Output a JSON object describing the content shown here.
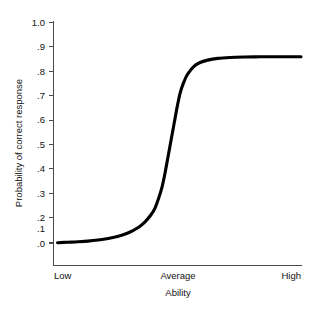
{
  "chart_data": {
    "type": "line",
    "title": "",
    "xlabel": "Ability",
    "ylabel": "Probability of correct response",
    "grid": false,
    "legend": "none",
    "xlim": [
      -3,
      3
    ],
    "ylim": [
      0,
      1
    ],
    "x_tick_labels": [
      "Low",
      "Average",
      "High"
    ],
    "x_tick_values": [
      -3,
      0,
      3
    ],
    "y_tick_labels": [
      "1.0",
      ".9",
      ".8",
      ".7",
      ".6",
      ".5",
      ".4",
      ".3",
      ".2",
      ".1",
      ".0"
    ],
    "y_tick_values": [
      1.0,
      0.9,
      0.8,
      0.7,
      0.6,
      0.5,
      0.4,
      0.3,
      0.2,
      0.1,
      0.0
    ],
    "series": [
      {
        "name": "Item characteristic curve",
        "x": [
          -3.0,
          -2.75,
          -2.5,
          -2.25,
          -2.0,
          -1.75,
          -1.5,
          -1.25,
          -1.0,
          -0.85,
          -0.7,
          -0.6,
          -0.5,
          -0.42,
          -0.35,
          -0.28,
          -0.2,
          -0.12,
          -0.05,
          0.02,
          0.1,
          0.2,
          0.35,
          0.5,
          0.7,
          0.95,
          1.25,
          1.6,
          2.0,
          2.4,
          2.8,
          3.0
        ],
        "y": [
          0.005,
          0.007,
          0.009,
          0.012,
          0.017,
          0.024,
          0.034,
          0.05,
          0.075,
          0.098,
          0.13,
          0.16,
          0.21,
          0.26,
          0.32,
          0.39,
          0.47,
          0.55,
          0.62,
          0.68,
          0.725,
          0.765,
          0.8,
          0.818,
          0.83,
          0.838,
          0.842,
          0.844,
          0.845,
          0.845,
          0.845,
          0.845
        ]
      }
    ],
    "notes": {
      "asymptote_upper": 0.845,
      "asymptote_lower": 0.005,
      "inflection_x_label": "just below Average"
    }
  },
  "axis": {
    "y_title": "Probability of correct response",
    "x_title": "Ability",
    "y_ticks": [
      "1.0",
      ".9",
      ".8",
      ".7",
      ".6",
      ".5",
      ".4",
      ".3",
      ".2",
      ".1",
      ".0"
    ],
    "x_ticks": [
      "Low",
      "Average",
      "High"
    ]
  },
  "colors": {
    "curve": "#000000",
    "axis": "#4a4a4a",
    "text": "#111111",
    "background": "#ffffff"
  }
}
